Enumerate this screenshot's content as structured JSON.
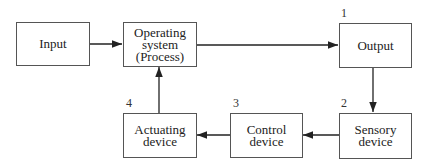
{
  "diagram": {
    "nodes": [
      {
        "id": "input",
        "label": "Input"
      },
      {
        "id": "operating",
        "label": "Operating system (Process)",
        "lines": [
          "Operating",
          "system",
          "(Process)"
        ]
      },
      {
        "id": "output",
        "label": "Output",
        "number": "1"
      },
      {
        "id": "sensory",
        "label": "Sensory device",
        "lines": [
          "Sensory",
          "device"
        ],
        "number": "2"
      },
      {
        "id": "control",
        "label": "Control device",
        "lines": [
          "Control",
          "device"
        ],
        "number": "3"
      },
      {
        "id": "actuating",
        "label": "Actuating device",
        "lines": [
          "Actuating",
          "device"
        ],
        "number": "4"
      }
    ],
    "edges": [
      {
        "from": "input",
        "to": "operating"
      },
      {
        "from": "operating",
        "to": "output"
      },
      {
        "from": "output",
        "to": "sensory"
      },
      {
        "from": "sensory",
        "to": "control"
      },
      {
        "from": "control",
        "to": "actuating"
      },
      {
        "from": "actuating",
        "to": "operating"
      }
    ]
  }
}
